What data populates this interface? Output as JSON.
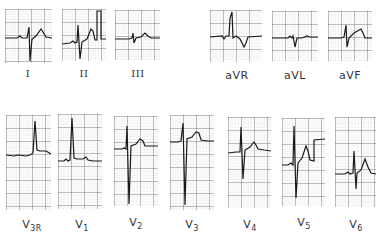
{
  "figure": {
    "grid_colors": {
      "major": "#555555",
      "minor": "#b8b8b8",
      "trace": "#1a1a1a"
    }
  },
  "leads_row1": [
    {
      "id": "I",
      "label": "I",
      "sub": "",
      "x": 5,
      "y": 9,
      "w": 47,
      "h": 54
    },
    {
      "id": "II",
      "label": "II",
      "sub": "",
      "x": 62,
      "y": 9,
      "w": 44,
      "h": 52
    },
    {
      "id": "III",
      "label": "III",
      "sub": "",
      "x": 115,
      "y": 10,
      "w": 45,
      "h": 50
    },
    {
      "id": "aVR",
      "label": "aVR",
      "sub": "",
      "x": 210,
      "y": 10,
      "w": 52,
      "h": 52
    },
    {
      "id": "aVL",
      "label": "aVL",
      "sub": "",
      "x": 272,
      "y": 11,
      "w": 46,
      "h": 50
    },
    {
      "id": "aVF",
      "label": "aVF",
      "sub": "",
      "x": 328,
      "y": 11,
      "w": 44,
      "h": 50
    }
  ],
  "leads_row2": [
    {
      "id": "V3R",
      "label": "V",
      "sub": "3R",
      "x": 6,
      "y": 115,
      "w": 45,
      "h": 95
    },
    {
      "id": "V1",
      "label": "V",
      "sub": "1",
      "x": 58,
      "y": 114,
      "w": 44,
      "h": 95
    },
    {
      "id": "V2",
      "label": "V",
      "sub": "2",
      "x": 114,
      "y": 116,
      "w": 44,
      "h": 90
    },
    {
      "id": "V3",
      "label": "V",
      "sub": "3",
      "x": 170,
      "y": 115,
      "w": 44,
      "h": 95
    },
    {
      "id": "V4",
      "label": "V",
      "sub": "4",
      "x": 228,
      "y": 117,
      "w": 43,
      "h": 91
    },
    {
      "id": "V5",
      "label": "V",
      "sub": "5",
      "x": 282,
      "y": 118,
      "w": 43,
      "h": 88
    },
    {
      "id": "V6",
      "label": "V",
      "sub": "6",
      "x": 335,
      "y": 117,
      "w": 41,
      "h": 90
    }
  ],
  "labels": {
    "I": "I",
    "II": "II",
    "III": "III",
    "aVR": "aVR",
    "aVL": "aVL",
    "aVF": "aVF",
    "V3R": "V",
    "V3R_sub": "3R",
    "V1": "V",
    "V1_sub": "1",
    "V2": "V",
    "V2_sub": "2",
    "V3": "V",
    "V3_sub": "3",
    "V4": "V",
    "V4_sub": "4",
    "V5": "V",
    "V5_sub": "5",
    "V6": "V",
    "V6_sub": "6"
  }
}
